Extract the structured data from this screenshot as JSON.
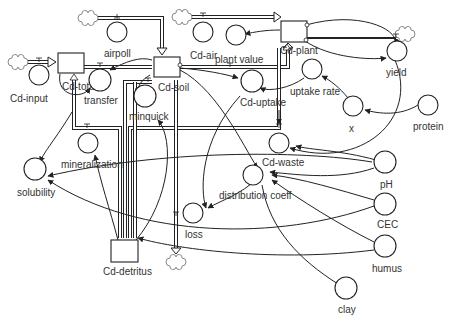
{
  "diagram": {
    "type": "stock-and-flow",
    "stocks": [
      {
        "id": "cd_total",
        "label": "Cd-total"
      },
      {
        "id": "cd_soil",
        "label": "Cd-soil"
      },
      {
        "id": "cd_plant",
        "label": "Cd-plant"
      },
      {
        "id": "cd_detritus",
        "label": "Cd-detritus"
      }
    ],
    "flows": [
      {
        "id": "cd_input",
        "label": "Cd-input"
      },
      {
        "id": "transfer",
        "label": "transfer"
      },
      {
        "id": "airpoll",
        "label": "airpoll"
      },
      {
        "id": "cd_air",
        "label": "Cd-air"
      },
      {
        "id": "cd_uptake",
        "label": "Cd-uptake"
      },
      {
        "id": "yield",
        "label": "yield"
      },
      {
        "id": "minquick",
        "label": "minquick"
      },
      {
        "id": "mineralization",
        "label": "mineralization"
      },
      {
        "id": "loss",
        "label": "loss"
      },
      {
        "id": "cd_waste",
        "label": "Cd-waste"
      }
    ],
    "converters": [
      {
        "id": "plant_value",
        "label": "plant value"
      },
      {
        "id": "uptake_rate",
        "label": "uptake rate"
      },
      {
        "id": "x",
        "label": "x"
      },
      {
        "id": "protein",
        "label": "protein"
      },
      {
        "id": "solubility",
        "label": "solubility"
      },
      {
        "id": "distribution_coeff",
        "label": "distribution coeff"
      },
      {
        "id": "ph",
        "label": "pH"
      },
      {
        "id": "cec",
        "label": "CEC"
      },
      {
        "id": "humus",
        "label": "humus"
      },
      {
        "id": "clay",
        "label": "clay"
      }
    ]
  },
  "labels": {
    "cd_input": "Cd-input",
    "cd_total": "Cd-total",
    "transfer": "transfer",
    "airpoll": "airpoll",
    "cd_soil": "Cd-soil",
    "minquick": "minquick",
    "cd_air": "Cd-air",
    "plant_value": "plant value",
    "cd_plant": "Cd-plant",
    "yield": "yield",
    "cd_uptake": "Cd-uptake",
    "uptake_rate": "uptake rate",
    "x": "x",
    "protein": "protein",
    "mineralization": "mineralization",
    "solubility": "solubility",
    "cd_waste": "Cd-waste",
    "distribution_coeff": "distribution coeff",
    "ph": "pH",
    "cec": "CEC",
    "humus": "humus",
    "loss": "loss",
    "cd_detritus": "Cd-detritus",
    "clay": "clay"
  },
  "colors": {
    "line": "#222222",
    "text": "#333333",
    "cloud": "#888888",
    "background": "#ffffff"
  }
}
